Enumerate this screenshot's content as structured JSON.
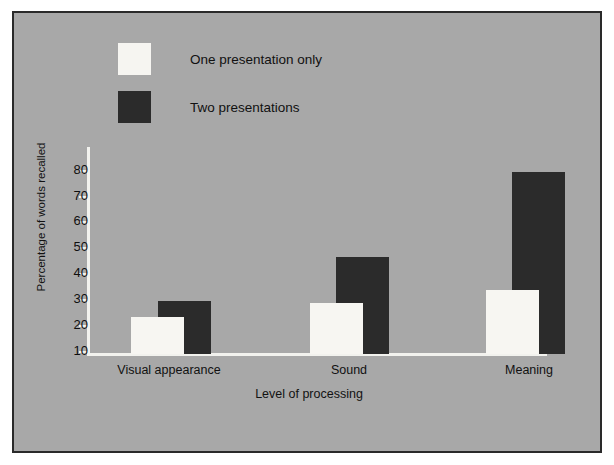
{
  "chart_data": {
    "type": "bar",
    "title": "",
    "xlabel": "Level of processing",
    "ylabel": "Percentage of words recalled",
    "categories": [
      "Visual appearance",
      "Sound",
      "Meaning"
    ],
    "series": [
      {
        "name": "One presentation only",
        "color": "#f7f6f2",
        "values": [
          16,
          22,
          28
        ]
      },
      {
        "name": "Two presentations",
        "color": "#2b2b2b",
        "values": [
          23,
          42,
          79
        ]
      }
    ],
    "ylim": [
      0,
      85
    ],
    "yticks": [
      10,
      20,
      30,
      40,
      50,
      60,
      70,
      80
    ],
    "ytick_labels": [
      "10",
      "20",
      "30",
      "40",
      "50",
      "60",
      "70",
      "80"
    ],
    "grid": false,
    "legend_position": "top-left",
    "background_color": "#a8a8a8",
    "axis_color": "#f2f2ee",
    "border_color": "#2a2a2a"
  },
  "legend": {
    "items": [
      {
        "label": "One presentation only",
        "swatch": "light-swatch"
      },
      {
        "label": "Two presentations",
        "swatch": "dark-swatch"
      }
    ]
  }
}
